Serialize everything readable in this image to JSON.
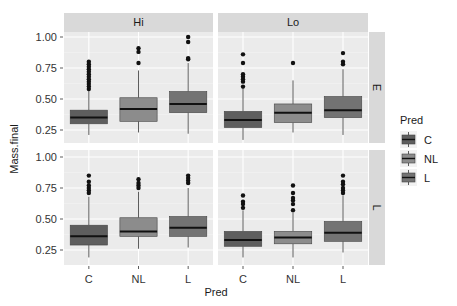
{
  "chart_data": {
    "type": "boxplot",
    "title": "",
    "xlabel": "Pred",
    "ylabel": "Mass.final",
    "categories": [
      "C",
      "NL",
      "L"
    ],
    "facet_cols": [
      "Hi",
      "Lo"
    ],
    "facet_rows": [
      "E",
      "L"
    ],
    "y_ticks": [
      0.25,
      0.5,
      0.75,
      1.0
    ],
    "y_tick_labels": [
      "0.25",
      "0.50",
      "0.75",
      "1.00"
    ],
    "ylim": [
      0.13,
      1.04
    ],
    "grid": true,
    "legend": {
      "title": "Pred",
      "position": "right",
      "entries": [
        {
          "label": "C",
          "color": "#5e5e5e"
        },
        {
          "label": "NL",
          "color": "#8c8c8c"
        },
        {
          "label": "L",
          "color": "#737373"
        }
      ]
    },
    "panels": [
      {
        "row": "E",
        "col": "Hi",
        "boxes": [
          {
            "category": "C",
            "low": 0.21,
            "q1": 0.3,
            "median": 0.35,
            "q3": 0.41,
            "high": 0.57,
            "outliers": [
              0.58,
              0.6,
              0.62,
              0.64,
              0.66,
              0.68,
              0.7,
              0.72,
              0.74,
              0.76,
              0.78,
              0.8
            ]
          },
          {
            "category": "NL",
            "low": 0.23,
            "q1": 0.32,
            "median": 0.42,
            "q3": 0.51,
            "high": 0.73,
            "outliers": [
              0.79,
              0.88,
              0.91
            ]
          },
          {
            "category": "L",
            "low": 0.22,
            "q1": 0.39,
            "median": 0.46,
            "q3": 0.56,
            "high": 0.79,
            "outliers": [
              0.82,
              0.83,
              0.96,
              1.0
            ]
          }
        ]
      },
      {
        "row": "E",
        "col": "Lo",
        "boxes": [
          {
            "category": "C",
            "low": 0.17,
            "q1": 0.27,
            "median": 0.33,
            "q3": 0.4,
            "high": 0.6,
            "outliers": [
              0.6,
              0.64,
              0.66,
              0.68,
              0.7,
              0.79,
              0.86
            ]
          },
          {
            "category": "NL",
            "low": 0.23,
            "q1": 0.31,
            "median": 0.39,
            "q3": 0.46,
            "high": 0.65,
            "outliers": [
              0.79
            ]
          },
          {
            "category": "L",
            "low": 0.21,
            "q1": 0.35,
            "median": 0.41,
            "q3": 0.52,
            "high": 0.74,
            "outliers": [
              0.78,
              0.8,
              0.87
            ]
          }
        ]
      },
      {
        "row": "L",
        "col": "Hi",
        "boxes": [
          {
            "category": "C",
            "low": 0.19,
            "q1": 0.29,
            "median": 0.36,
            "q3": 0.45,
            "high": 0.68,
            "outliers": [
              0.71,
              0.73,
              0.75,
              0.77,
              0.8,
              0.85
            ]
          },
          {
            "category": "NL",
            "low": 0.26,
            "q1": 0.36,
            "median": 0.4,
            "q3": 0.51,
            "high": 0.72,
            "outliers": [
              0.75,
              0.77,
              0.79,
              0.82
            ]
          },
          {
            "category": "L",
            "low": 0.27,
            "q1": 0.36,
            "median": 0.43,
            "q3": 0.52,
            "high": 0.75,
            "outliers": [
              0.79,
              0.81,
              0.83,
              0.85
            ]
          }
        ]
      },
      {
        "row": "L",
        "col": "Lo",
        "boxes": [
          {
            "category": "C",
            "low": 0.19,
            "q1": 0.28,
            "median": 0.33,
            "q3": 0.4,
            "high": 0.57,
            "outliers": [
              0.59,
              0.62,
              0.64,
              0.69
            ]
          },
          {
            "category": "NL",
            "low": 0.19,
            "q1": 0.3,
            "median": 0.35,
            "q3": 0.4,
            "high": 0.55,
            "outliers": [
              0.57,
              0.62,
              0.65,
              0.67,
              0.71,
              0.77
            ]
          },
          {
            "category": "L",
            "low": 0.23,
            "q1": 0.32,
            "median": 0.39,
            "q3": 0.48,
            "high": 0.69,
            "outliers": [
              0.71,
              0.73,
              0.75,
              0.78,
              0.8,
              0.85
            ]
          }
        ]
      }
    ]
  },
  "colors": {
    "panel_bg": "#ebebeb",
    "strip_bg": "#d9d9d9",
    "grid_major": "#ffffff",
    "grid_minor": "#f3f3f3",
    "whisker": "#333333",
    "median": "#111111",
    "outlier": "#111111",
    "text": "#1a1a1a"
  }
}
